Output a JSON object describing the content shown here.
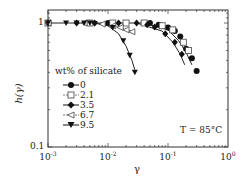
{
  "chart_data": {
    "type": "scatter",
    "title": "",
    "xlabel": "γ",
    "ylabel": "h(γ)",
    "xscale": "log",
    "yscale": "log",
    "xlim": [
      0.001,
      1
    ],
    "ylim": [
      0.1,
      1.2
    ],
    "x_ticks": [
      "10^-3",
      "10^-2",
      "10^-1",
      "10^0"
    ],
    "y_ticks": [
      "0.1",
      "1"
    ],
    "grid": false,
    "annotation": "T = 85°C",
    "legend": {
      "title": "wt% of silicate",
      "position": "left-center",
      "entries": [
        "0",
        "2.1",
        "3.5",
        "6.7",
        "9.5"
      ]
    },
    "series": [
      {
        "name": "0",
        "marker": "filled-circle",
        "x": [
          0.001,
          0.01,
          0.05,
          0.07,
          0.1,
          0.13,
          0.16,
          0.2,
          0.25,
          0.3
        ],
        "y": [
          1.0,
          1.0,
          1.0,
          0.97,
          0.92,
          0.86,
          0.78,
          0.62,
          0.52,
          0.41
        ]
      },
      {
        "name": "2.1",
        "marker": "open-square",
        "x": [
          0.001,
          0.005,
          0.012,
          0.02,
          0.04,
          0.08,
          0.12,
          0.18,
          0.22
        ],
        "y": [
          1.0,
          1.0,
          1.0,
          1.0,
          1.0,
          0.95,
          0.88,
          0.7,
          0.6
        ]
      },
      {
        "name": "3.5",
        "marker": "filled-diamond",
        "x": [
          0.001,
          0.003,
          0.006,
          0.015,
          0.03,
          0.045,
          0.06,
          0.09,
          0.13,
          0.17
        ],
        "y": [
          1.0,
          1.0,
          1.0,
          1.0,
          1.0,
          0.97,
          0.93,
          0.82,
          0.7,
          0.56
        ]
      },
      {
        "name": "6.7",
        "marker": "open-triangle-left",
        "x": [
          0.001,
          0.004,
          0.008,
          0.012,
          0.016,
          0.02,
          0.025
        ],
        "y": [
          1.0,
          1.0,
          0.98,
          0.95,
          0.92,
          0.88,
          0.85
        ]
      },
      {
        "name": "9.5",
        "marker": "filled-triangle-down",
        "x": [
          0.001,
          0.002,
          0.003,
          0.004,
          0.005,
          0.006,
          0.012,
          0.018,
          0.023,
          0.028
        ],
        "y": [
          1.0,
          1.0,
          1.0,
          1.0,
          1.0,
          0.99,
          0.92,
          0.72,
          0.55,
          0.4
        ]
      }
    ],
    "fit_lines": [
      {
        "for_series": "0",
        "x": [
          0.04,
          0.1,
          0.15,
          0.2,
          0.25
        ],
        "y": [
          1.0,
          0.88,
          0.72,
          0.58,
          0.46
        ]
      },
      {
        "for_series": "3.5",
        "x": [
          0.03,
          0.08,
          0.12,
          0.16,
          0.19
        ],
        "y": [
          1.0,
          0.86,
          0.7,
          0.56,
          0.46
        ]
      },
      {
        "for_series": "6.7",
        "x": [
          0.005,
          0.012,
          0.02,
          0.028
        ],
        "y": [
          1.0,
          0.95,
          0.89,
          0.84
        ]
      },
      {
        "for_series": "9.5",
        "x": [
          0.006,
          0.01,
          0.015,
          0.02,
          0.025,
          0.028
        ],
        "y": [
          1.0,
          0.95,
          0.82,
          0.65,
          0.5,
          0.42
        ]
      }
    ]
  },
  "axes": {
    "xlabel": "γ",
    "ylabel": "h(γ)",
    "xticks": [
      {
        "base": "10",
        "exp": "-3"
      },
      {
        "base": "10",
        "exp": "-2"
      },
      {
        "base": "10",
        "exp": "-1"
      },
      {
        "base": "10",
        "exp": "0"
      }
    ],
    "yticks": [
      "1",
      "0.1"
    ]
  },
  "legend": {
    "title": "wt% of silicate",
    "items": [
      "0",
      "2.1",
      "3.5",
      "6.7",
      "9.5"
    ]
  },
  "annotation": "T = 85°C"
}
